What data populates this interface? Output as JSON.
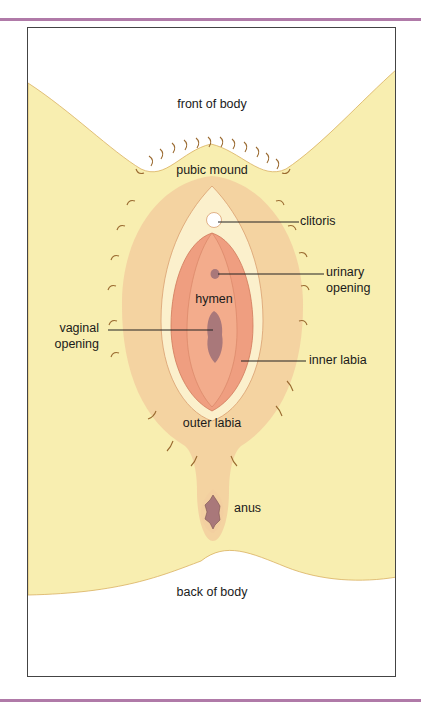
{
  "figure": {
    "type": "labeled anatomical illustration",
    "colors": {
      "accent_band": "#b07aa8",
      "skin_light": "#f8eeb0",
      "outer_region": "#f3cfa0",
      "inner_region": "#ef9e80",
      "pale_ring": "#fbf0cc",
      "opening_fill": "#a9787a",
      "hair": "#9a6a30",
      "leader_line": "#222222"
    },
    "labels": {
      "front": "front of body",
      "pubic_mound": "pubic mound",
      "clitoris": "clitoris",
      "urinary_line1": "urinary",
      "urinary_line2": "opening",
      "hymen": "hymen",
      "vaginal_line1": "vaginal",
      "vaginal_line2": "opening",
      "inner_labia": "inner labia",
      "outer_labia": "outer labia",
      "anus": "anus",
      "back": "back of body"
    }
  }
}
